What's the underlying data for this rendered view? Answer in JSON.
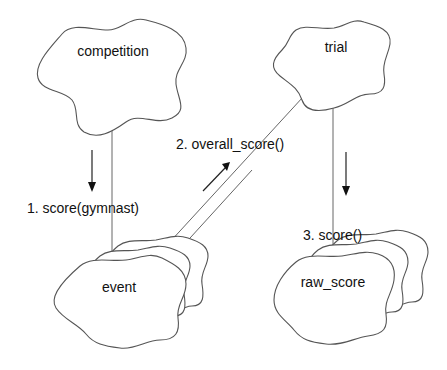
{
  "diagram": {
    "type": "collaboration-diagram",
    "notation": "Booch object clouds",
    "colors": {
      "background": "#ffffff",
      "stroke": "#555555",
      "text": "#111111"
    },
    "objects": [
      {
        "id": "competition",
        "label": "competition",
        "multiple": false
      },
      {
        "id": "trial",
        "label": "trial",
        "multiple": false
      },
      {
        "id": "event",
        "label": "event",
        "multiple": true
      },
      {
        "id": "raw_score",
        "label": "raw_score",
        "multiple": true
      }
    ],
    "links": [
      {
        "from": "competition",
        "to": "event"
      },
      {
        "from": "trial",
        "to": "event"
      },
      {
        "from": "trial",
        "to": "raw_score"
      }
    ],
    "messages": [
      {
        "seq": 1,
        "label": "1. score(gymnast)",
        "from": "competition",
        "to": "event",
        "direction": "down"
      },
      {
        "seq": 2,
        "label": "2. overall_score()",
        "from": "event",
        "to": "trial",
        "direction": "up-right"
      },
      {
        "seq": 3,
        "label": "3. score()",
        "from": "trial",
        "to": "raw_score",
        "direction": "down"
      }
    ]
  }
}
